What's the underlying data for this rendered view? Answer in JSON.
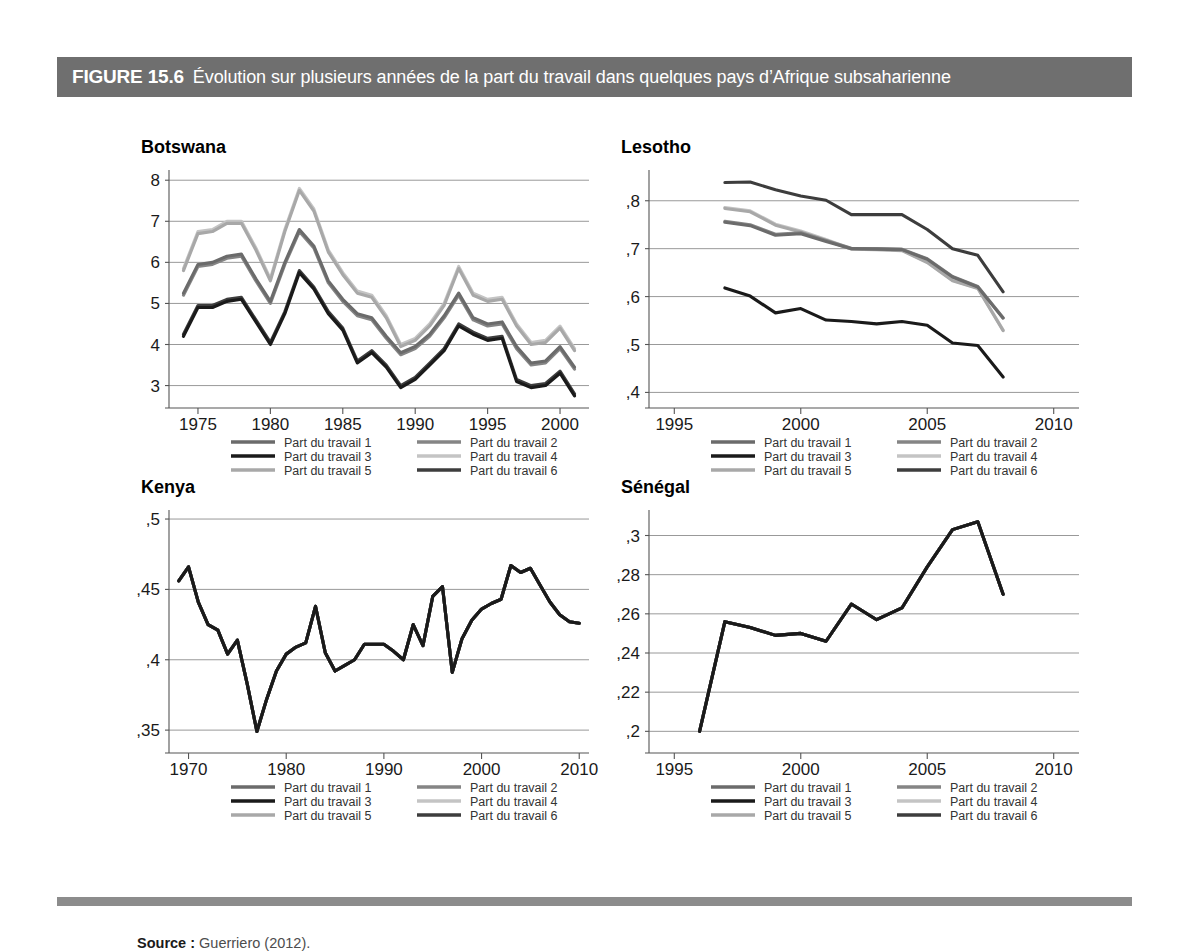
{
  "figure": {
    "number": "FIGURE 15.6",
    "caption": "Évolution sur plusieurs années de la part du travail dans quelques pays d’Afrique subsaharienne",
    "header_bg": "#6f6f6f",
    "header_text_color": "#ffffff",
    "footer_rule_color": "#8c8c8c"
  },
  "source": {
    "label": "Source :",
    "text": "Guerriero (2012)."
  },
  "legend": {
    "entries": [
      {
        "label": "Part du travail 1",
        "color": "#6b6b6b"
      },
      {
        "label": "Part du travail 2",
        "color": "#858585"
      },
      {
        "label": "Part du travail 3",
        "color": "#1a1a1a"
      },
      {
        "label": "Part du travail 4",
        "color": "#c4c4c4"
      },
      {
        "label": "Part du travail 5",
        "color": "#a8a8a8"
      },
      {
        "label": "Part du travail 6",
        "color": "#3d3d3d"
      }
    ],
    "column_order": [
      0,
      2,
      4,
      1,
      3,
      5
    ]
  },
  "chart_data": [
    {
      "type": "line",
      "title": "Botswana",
      "xlabel": "",
      "ylabel": "",
      "xlim": [
        1973,
        2002
      ],
      "ylim": [
        2.6,
        8.2
      ],
      "xticks": [
        1975,
        1980,
        1985,
        1990,
        1995,
        2000
      ],
      "xticklabels": [
        "1975",
        "1980",
        "1985",
        "1990",
        "1995",
        "2000"
      ],
      "yticks": [
        3,
        4,
        5,
        6,
        7,
        8
      ],
      "yticklabels": [
        "3",
        "4",
        "5",
        "6",
        "7",
        "8"
      ],
      "grid": true,
      "legend_position": "below",
      "x": [
        1974,
        1975,
        1976,
        1977,
        1978,
        1979,
        1980,
        1981,
        1982,
        1983,
        1984,
        1985,
        1986,
        1987,
        1988,
        1989,
        1990,
        1991,
        1992,
        1993,
        1994,
        1995,
        1996,
        1997,
        1998,
        1999,
        2000,
        2001
      ],
      "series": [
        {
          "name": "Part du travail 1",
          "color": "#6b6b6b",
          "values": [
            5.25,
            5.95,
            6.0,
            6.15,
            6.2,
            5.6,
            5.05,
            6.0,
            6.8,
            6.4,
            5.55,
            5.1,
            4.75,
            4.65,
            4.2,
            3.8,
            3.95,
            4.25,
            4.7,
            5.25,
            4.65,
            4.5,
            4.55,
            3.95,
            3.55,
            3.6,
            3.95,
            3.45
          ]
        },
        {
          "name": "Part du travail 2",
          "color": "#858585",
          "values": [
            5.2,
            5.9,
            5.95,
            6.1,
            6.15,
            5.55,
            5.0,
            5.95,
            6.75,
            6.35,
            5.5,
            5.05,
            4.7,
            4.6,
            4.15,
            3.75,
            3.9,
            4.2,
            4.65,
            5.2,
            4.6,
            4.45,
            4.5,
            3.9,
            3.5,
            3.55,
            3.9,
            3.4
          ]
        },
        {
          "name": "Part du travail 3",
          "color": "#1a1a1a",
          "values": [
            4.2,
            4.9,
            4.9,
            5.05,
            5.1,
            4.55,
            4.0,
            4.75,
            5.75,
            5.35,
            4.75,
            4.35,
            3.55,
            3.8,
            3.45,
            2.95,
            3.15,
            3.5,
            3.85,
            4.45,
            4.25,
            4.1,
            4.15,
            3.1,
            2.95,
            3.0,
            3.3,
            2.75
          ]
        },
        {
          "name": "Part du travail 4",
          "color": "#c4c4c4",
          "values": [
            5.85,
            6.75,
            6.8,
            7.0,
            7.0,
            6.35,
            5.6,
            6.8,
            7.8,
            7.3,
            6.3,
            5.75,
            5.3,
            5.2,
            4.7,
            4.0,
            4.15,
            4.5,
            5.0,
            5.9,
            5.25,
            5.1,
            5.15,
            4.5,
            4.05,
            4.1,
            4.45,
            3.9
          ]
        },
        {
          "name": "Part du travail 5",
          "color": "#a8a8a8",
          "values": [
            5.8,
            6.7,
            6.75,
            6.95,
            6.95,
            6.3,
            5.55,
            6.75,
            7.75,
            7.25,
            6.25,
            5.7,
            5.25,
            5.15,
            4.65,
            3.95,
            4.1,
            4.45,
            4.95,
            5.85,
            5.2,
            5.05,
            5.1,
            4.45,
            4.0,
            4.05,
            4.4,
            3.85
          ]
        },
        {
          "name": "Part du travail 6",
          "color": "#3d3d3d",
          "values": [
            4.25,
            4.95,
            4.95,
            5.1,
            5.15,
            4.6,
            4.05,
            4.8,
            5.8,
            5.4,
            4.8,
            4.4,
            3.6,
            3.85,
            3.5,
            3.0,
            3.2,
            3.55,
            3.9,
            4.5,
            4.3,
            4.15,
            4.2,
            3.15,
            3.0,
            3.05,
            3.35,
            2.8
          ]
        }
      ]
    },
    {
      "type": "line",
      "title": "Lesotho",
      "xlabel": "",
      "ylabel": "",
      "xlim": [
        1994,
        2011
      ],
      "ylim": [
        0.38,
        0.86
      ],
      "xticks": [
        1995,
        2000,
        2005,
        2010
      ],
      "xticklabels": [
        "1995",
        "2000",
        "2005",
        "2010"
      ],
      "yticks": [
        0.4,
        0.5,
        0.6,
        0.7,
        0.8
      ],
      "yticklabels": [
        ",4",
        ",5",
        ",6",
        ",7",
        ",8"
      ],
      "grid": true,
      "legend_position": "below",
      "x": [
        1997,
        1998,
        1999,
        2000,
        2001,
        2002,
        2003,
        2004,
        2005,
        2006,
        2007,
        2008
      ],
      "series": [
        {
          "name": "Part du travail 1",
          "color": "#6b6b6b",
          "values": [
            0.755,
            0.748,
            0.728,
            0.731,
            0.715,
            0.7,
            0.699,
            0.698,
            0.678,
            0.641,
            0.62,
            0.555
          ]
        },
        {
          "name": "Part du travail 2",
          "color": "#858585",
          "values": [
            0.757,
            0.75,
            0.73,
            0.733,
            0.717,
            0.701,
            0.7,
            0.699,
            0.679,
            0.642,
            0.621,
            0.556
          ]
        },
        {
          "name": "Part du travail 3",
          "color": "#1a1a1a",
          "values": [
            0.618,
            0.601,
            0.566,
            0.575,
            0.551,
            0.548,
            0.543,
            0.548,
            0.54,
            0.503,
            0.498,
            0.432
          ]
        },
        {
          "name": "Part du travail 4",
          "color": "#c4c4c4",
          "values": [
            0.786,
            0.779,
            0.751,
            0.737,
            0.719,
            0.7,
            0.699,
            0.697,
            0.672,
            0.634,
            0.618,
            0.53
          ]
        },
        {
          "name": "Part du travail 5",
          "color": "#a8a8a8",
          "values": [
            0.784,
            0.777,
            0.749,
            0.735,
            0.717,
            0.699,
            0.698,
            0.696,
            0.671,
            0.633,
            0.617,
            0.529
          ]
        },
        {
          "name": "Part du travail 6",
          "color": "#3d3d3d",
          "values": [
            0.838,
            0.839,
            0.823,
            0.81,
            0.801,
            0.771,
            0.771,
            0.771,
            0.74,
            0.7,
            0.686,
            0.61
          ]
        }
      ]
    },
    {
      "type": "line",
      "title": "Kenya",
      "xlabel": "",
      "ylabel": "",
      "xlim": [
        1968,
        2011
      ],
      "ylim": [
        0.338,
        0.505
      ],
      "xticks": [
        1970,
        1980,
        1990,
        2000,
        2010
      ],
      "xticklabels": [
        "1970",
        "1980",
        "1990",
        "2000",
        "2010"
      ],
      "yticks": [
        0.35,
        0.4,
        0.45,
        0.5
      ],
      "yticklabels": [
        ",35",
        ",4",
        ",45",
        ",5"
      ],
      "grid": true,
      "legend_position": "below",
      "x": [
        1969,
        1970,
        1971,
        1972,
        1973,
        1974,
        1975,
        1976,
        1977,
        1978,
        1979,
        1980,
        1981,
        1982,
        1983,
        1984,
        1985,
        1986,
        1987,
        1988,
        1989,
        1990,
        1991,
        1992,
        1993,
        1994,
        1995,
        1996,
        1997,
        1998,
        1999,
        2000,
        2001,
        2002,
        2003,
        2004,
        2005,
        2006,
        2007,
        2008,
        2009,
        2010
      ],
      "series": [
        {
          "name": "Part du travail 1",
          "color": "#6b6b6b",
          "values": [
            0.456,
            0.466,
            0.441,
            0.425,
            0.421,
            0.404,
            0.414,
            0.383,
            0.349,
            0.372,
            0.392,
            0.404,
            0.409,
            0.412,
            0.438,
            0.405,
            0.392,
            0.396,
            0.4,
            0.411,
            0.411,
            0.411,
            0.406,
            0.4,
            0.425,
            0.41,
            0.445,
            0.452,
            0.391,
            0.415,
            0.428,
            0.436,
            0.44,
            0.443,
            0.467,
            0.462,
            0.465,
            0.453,
            0.441,
            0.432,
            0.427,
            0.426
          ]
        },
        {
          "name": "Part du travail 2",
          "color": "#858585",
          "values": [
            0.456,
            0.466,
            0.441,
            0.425,
            0.421,
            0.404,
            0.414,
            0.383,
            0.349,
            0.372,
            0.392,
            0.404,
            0.409,
            0.412,
            0.438,
            0.405,
            0.392,
            0.396,
            0.4,
            0.411,
            0.411,
            0.411,
            0.406,
            0.4,
            0.425,
            0.41,
            0.445,
            0.452,
            0.391,
            0.415,
            0.428,
            0.436,
            0.44,
            0.443,
            0.467,
            0.462,
            0.465,
            0.453,
            0.441,
            0.432,
            0.427,
            0.426
          ]
        },
        {
          "name": "Part du travail 3",
          "color": "#1a1a1a",
          "values": [
            0.456,
            0.466,
            0.441,
            0.425,
            0.421,
            0.404,
            0.414,
            0.383,
            0.349,
            0.372,
            0.392,
            0.404,
            0.409,
            0.412,
            0.438,
            0.405,
            0.392,
            0.396,
            0.4,
            0.411,
            0.411,
            0.411,
            0.406,
            0.4,
            0.425,
            0.41,
            0.445,
            0.452,
            0.391,
            0.415,
            0.428,
            0.436,
            0.44,
            0.443,
            0.467,
            0.462,
            0.465,
            0.453,
            0.441,
            0.432,
            0.427,
            0.426
          ]
        },
        {
          "name": "Part du travail 4",
          "color": "#c4c4c4",
          "values": [
            0.456,
            0.466,
            0.441,
            0.425,
            0.421,
            0.404,
            0.414,
            0.383,
            0.349,
            0.372,
            0.392,
            0.404,
            0.409,
            0.412,
            0.438,
            0.405,
            0.392,
            0.396,
            0.4,
            0.411,
            0.411,
            0.411,
            0.406,
            0.4,
            0.425,
            0.41,
            0.445,
            0.452,
            0.391,
            0.415,
            0.428,
            0.436,
            0.44,
            0.443,
            0.467,
            0.462,
            0.465,
            0.453,
            0.441,
            0.432,
            0.427,
            0.426
          ]
        },
        {
          "name": "Part du travail 5",
          "color": "#a8a8a8",
          "values": [
            0.456,
            0.466,
            0.441,
            0.425,
            0.421,
            0.404,
            0.414,
            0.383,
            0.349,
            0.372,
            0.392,
            0.404,
            0.409,
            0.412,
            0.438,
            0.405,
            0.392,
            0.396,
            0.4,
            0.411,
            0.411,
            0.411,
            0.406,
            0.4,
            0.425,
            0.41,
            0.445,
            0.452,
            0.391,
            0.415,
            0.428,
            0.436,
            0.44,
            0.443,
            0.467,
            0.462,
            0.465,
            0.453,
            0.441,
            0.432,
            0.427,
            0.426
          ]
        },
        {
          "name": "Part du travail 6",
          "color": "#3d3d3d",
          "values": [
            0.456,
            0.466,
            0.441,
            0.425,
            0.421,
            0.404,
            0.414,
            0.383,
            0.349,
            0.372,
            0.392,
            0.404,
            0.409,
            0.412,
            0.438,
            0.405,
            0.392,
            0.396,
            0.4,
            0.411,
            0.411,
            0.411,
            0.406,
            0.4,
            0.425,
            0.41,
            0.445,
            0.452,
            0.391,
            0.415,
            0.428,
            0.436,
            0.44,
            0.443,
            0.467,
            0.462,
            0.465,
            0.453,
            0.441,
            0.432,
            0.427,
            0.426
          ]
        }
      ]
    },
    {
      "type": "line",
      "title": "Sénégal",
      "xlabel": "",
      "ylabel": "",
      "xlim": [
        1994,
        2011
      ],
      "ylim": [
        0.192,
        0.312
      ],
      "xticks": [
        1995,
        2000,
        2005,
        2010
      ],
      "xticklabels": [
        "1995",
        "2000",
        "2005",
        "2010"
      ],
      "yticks": [
        0.2,
        0.22,
        0.24,
        0.26,
        0.28,
        0.3
      ],
      "yticklabels": [
        ",2",
        ",22",
        ",24",
        ",26",
        ",28",
        ",3"
      ],
      "grid": true,
      "legend_position": "below",
      "x": [
        1996,
        1997,
        1998,
        1999,
        2000,
        2001,
        2002,
        2003,
        2004,
        2005,
        2006,
        2007,
        2008
      ],
      "series": [
        {
          "name": "Part du travail 1",
          "color": "#6b6b6b",
          "values": [
            0.2,
            0.256,
            0.253,
            0.249,
            0.25,
            0.246,
            0.265,
            0.257,
            0.263,
            0.284,
            0.303,
            0.307,
            0.27
          ]
        },
        {
          "name": "Part du travail 2",
          "color": "#858585",
          "values": [
            0.2,
            0.256,
            0.253,
            0.249,
            0.25,
            0.246,
            0.265,
            0.257,
            0.263,
            0.284,
            0.303,
            0.307,
            0.27
          ]
        },
        {
          "name": "Part du travail 3",
          "color": "#1a1a1a",
          "values": [
            0.2,
            0.256,
            0.253,
            0.249,
            0.25,
            0.246,
            0.265,
            0.257,
            0.263,
            0.284,
            0.303,
            0.307,
            0.27
          ]
        },
        {
          "name": "Part du travail 4",
          "color": "#c4c4c4",
          "values": [
            0.2,
            0.256,
            0.253,
            0.249,
            0.25,
            0.246,
            0.265,
            0.257,
            0.263,
            0.284,
            0.303,
            0.307,
            0.27
          ]
        },
        {
          "name": "Part du travail 5",
          "color": "#a8a8a8",
          "values": [
            0.2,
            0.256,
            0.253,
            0.249,
            0.25,
            0.246,
            0.265,
            0.257,
            0.263,
            0.284,
            0.303,
            0.307,
            0.27
          ]
        },
        {
          "name": "Part du travail 6",
          "color": "#3d3d3d",
          "values": [
            0.2,
            0.256,
            0.253,
            0.249,
            0.25,
            0.246,
            0.265,
            0.257,
            0.263,
            0.284,
            0.303,
            0.307,
            0.27
          ]
        }
      ]
    }
  ],
  "panel_layout": [
    {
      "left": 60,
      "top": 40,
      "plot_w": 420,
      "plot_h": 230
    },
    {
      "left": 540,
      "top": 40,
      "plot_w": 430,
      "plot_h": 230
    },
    {
      "left": 60,
      "top": 380,
      "plot_w": 420,
      "plot_h": 235
    },
    {
      "left": 540,
      "top": 380,
      "plot_w": 430,
      "plot_h": 235
    }
  ]
}
